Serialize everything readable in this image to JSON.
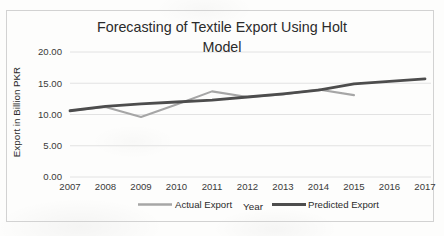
{
  "chart_data": {
    "type": "line",
    "title": "Forecasting of Textile Export Using Holt Model",
    "title_line1": "Forecasting of Textile Export Using Holt",
    "title_line2": "Model",
    "xlabel": "Year",
    "ylabel": "Export in Billion PKR",
    "grid": true,
    "legend_position": "bottom",
    "x": [
      2007,
      2008,
      2009,
      2010,
      2011,
      2012,
      2013,
      2014,
      2015,
      2016,
      2017
    ],
    "xtick_labels": [
      "2007",
      "2008",
      "2009",
      "2010",
      "2011",
      "2012",
      "2013",
      "2014",
      "2015",
      "2016",
      "2017"
    ],
    "ylim": [
      0.0,
      20.0
    ],
    "ytick_values": [
      0.0,
      5.0,
      10.0,
      15.0,
      20.0
    ],
    "ytick_labels": [
      "0.00",
      "5.00",
      "10.00",
      "15.00",
      "20.00"
    ],
    "xlim": [
      2007,
      2017
    ],
    "series": [
      {
        "name": "Actual Export",
        "color": "#a6a6a6",
        "width": 2.1,
        "x": [
          2007,
          2008,
          2009,
          2010,
          2011,
          2012,
          2013,
          2014,
          2015
        ],
        "values": [
          10.6,
          11.2,
          9.6,
          11.6,
          13.7,
          12.8,
          13.2,
          14.0,
          13.1
        ]
      },
      {
        "name": "Predicted Export",
        "color": "#4d4d4d",
        "width": 2.8,
        "x": [
          2007,
          2008,
          2009,
          2010,
          2011,
          2012,
          2013,
          2014,
          2015,
          2016,
          2017
        ],
        "values": [
          10.6,
          11.3,
          11.7,
          12.0,
          12.3,
          12.8,
          13.3,
          13.9,
          14.9,
          15.3,
          15.7
        ]
      }
    ]
  },
  "legend": {
    "items": [
      {
        "label": "Actual Export",
        "color": "#a6a6a6"
      },
      {
        "label": "Predicted Export",
        "color": "#4d4d4d"
      }
    ]
  }
}
